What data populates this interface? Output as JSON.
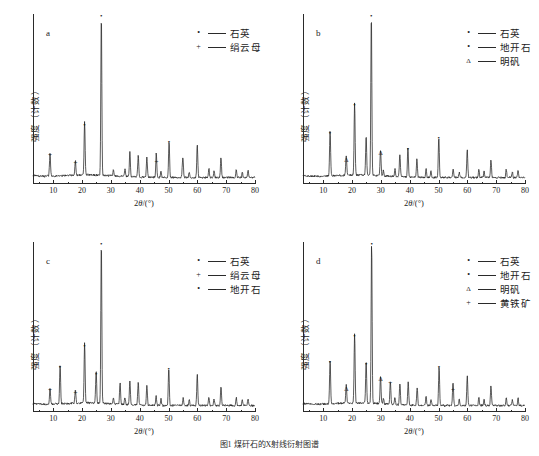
{
  "figure": {
    "caption": "图1  煤矸石的X射线衍射图谱",
    "xlabel_prefix": "2",
    "xlabel_italic": "θ",
    "xlabel_suffix": "/(°)",
    "ylabel": "强度（计数）",
    "marker_dot": "•",
    "marker_plus": "+",
    "marker_triangle": "Δ"
  },
  "axis": {
    "xticks": [
      10,
      20,
      30,
      40,
      50,
      60,
      70,
      80
    ],
    "xmin": 3,
    "xmax": 80
  },
  "panels": [
    {
      "letter": "a",
      "legend": [
        {
          "marker": "•",
          "label": "石英"
        },
        {
          "marker": "+",
          "label": "绢云母"
        }
      ]
    },
    {
      "letter": "b",
      "legend": [
        {
          "marker": "•",
          "label": "石英"
        },
        {
          "marker": "•",
          "label": "地开石"
        },
        {
          "marker": "Δ",
          "label": "明矾"
        }
      ]
    },
    {
      "letter": "c",
      "legend": [
        {
          "marker": "•",
          "label": "石英"
        },
        {
          "marker": "+",
          "label": "绢云母"
        },
        {
          "marker": "•",
          "label": "地开石"
        }
      ]
    },
    {
      "letter": "d",
      "legend": [
        {
          "marker": "•",
          "label": "石英"
        },
        {
          "marker": "•",
          "label": "地开石"
        },
        {
          "marker": "Δ",
          "label": "明矾"
        },
        {
          "marker": "+",
          "label": "黄铁矿"
        }
      ]
    }
  ],
  "chart_data": [
    {
      "type": "line",
      "panel": "a",
      "title": "XRD pattern (a)",
      "xlabel": "2θ/(°)",
      "ylabel": "强度（计数）",
      "xlim": [
        3,
        80
      ],
      "ylim": [
        0,
        100
      ],
      "grid": false,
      "legend_position": "top-right",
      "series": [
        {
          "name": "煤矸石 a",
          "peaks": [
            {
              "x": 8.9,
              "intensity": 14,
              "phase": "绢云母",
              "marker": "+",
              "labeled": true
            },
            {
              "x": 17.7,
              "intensity": 9,
              "phase": "绢云母",
              "marker": "+",
              "labeled": true
            },
            {
              "x": 20.9,
              "intensity": 33,
              "phase": "石英",
              "marker": "•",
              "labeled": true
            },
            {
              "x": 26.7,
              "intensity": 100,
              "phase": "石英",
              "marker": "•",
              "labeled": true
            },
            {
              "x": 36.6,
              "intensity": 15,
              "phase": "石英",
              "marker": "",
              "labeled": false
            },
            {
              "x": 39.5,
              "intensity": 13,
              "phase": "石英",
              "marker": "",
              "labeled": false
            },
            {
              "x": 42.5,
              "intensity": 12,
              "phase": "石英",
              "marker": "",
              "labeled": false
            },
            {
              "x": 45.8,
              "intensity": 10,
              "phase": "绢云母",
              "marker": "+",
              "labeled": true
            },
            {
              "x": 50.2,
              "intensity": 22,
              "phase": "石英",
              "marker": "•",
              "labeled": true
            },
            {
              "x": 54.9,
              "intensity": 9,
              "phase": "石英",
              "marker": "",
              "labeled": false
            },
            {
              "x": 60.0,
              "intensity": 16,
              "phase": "石英",
              "marker": "",
              "labeled": false
            },
            {
              "x": 68.2,
              "intensity": 12,
              "phase": "石英",
              "marker": "",
              "labeled": false
            }
          ]
        }
      ]
    },
    {
      "type": "line",
      "panel": "b",
      "title": "XRD pattern (b)",
      "xlabel": "2θ/(°)",
      "ylabel": "强度（计数）",
      "xlim": [
        3,
        80
      ],
      "ylim": [
        0,
        100
      ],
      "grid": false,
      "legend_position": "top-right",
      "series": [
        {
          "name": "煤矸石 b",
          "peaks": [
            {
              "x": 12.4,
              "intensity": 28,
              "phase": "地开石",
              "marker": "•",
              "labeled": true
            },
            {
              "x": 18.0,
              "intensity": 12,
              "phase": "明矾",
              "marker": "Δ",
              "labeled": true
            },
            {
              "x": 20.9,
              "intensity": 45,
              "phase": "石英",
              "marker": "•",
              "labeled": true
            },
            {
              "x": 24.9,
              "intensity": 24,
              "phase": "地开石",
              "marker": "",
              "labeled": false
            },
            {
              "x": 26.7,
              "intensity": 100,
              "phase": "石英",
              "marker": "•",
              "labeled": true
            },
            {
              "x": 29.9,
              "intensity": 16,
              "phase": "明矾",
              "marker": "Δ",
              "labeled": true
            },
            {
              "x": 36.6,
              "intensity": 14,
              "phase": "石英",
              "marker": "",
              "labeled": false
            },
            {
              "x": 39.4,
              "intensity": 18,
              "phase": "石英",
              "marker": "•",
              "labeled": true
            },
            {
              "x": 42.5,
              "intensity": 11,
              "phase": "石英",
              "marker": "",
              "labeled": false
            },
            {
              "x": 50.1,
              "intensity": 25,
              "phase": "石英",
              "marker": "•",
              "labeled": true
            },
            {
              "x": 60.0,
              "intensity": 13,
              "phase": "石英",
              "marker": "",
              "labeled": false
            },
            {
              "x": 68.2,
              "intensity": 11,
              "phase": "石英",
              "marker": "",
              "labeled": false
            }
          ]
        }
      ]
    },
    {
      "type": "line",
      "panel": "c",
      "title": "XRD pattern (c)",
      "xlabel": "2θ/(°)",
      "ylabel": "强度（计数）",
      "xlim": [
        3,
        80
      ],
      "ylim": [
        0,
        100
      ],
      "grid": false,
      "legend_position": "top-right",
      "series": [
        {
          "name": "煤矸石 c",
          "peaks": [
            {
              "x": 8.9,
              "intensity": 10,
              "phase": "绢云母",
              "marker": "+",
              "labeled": true
            },
            {
              "x": 12.4,
              "intensity": 24,
              "phase": "地开石",
              "marker": "•",
              "labeled": true
            },
            {
              "x": 17.7,
              "intensity": 8,
              "phase": "绢云母",
              "marker": "+",
              "labeled": true
            },
            {
              "x": 20.9,
              "intensity": 37,
              "phase": "石英",
              "marker": "•",
              "labeled": true
            },
            {
              "x": 24.9,
              "intensity": 20,
              "phase": "地开石",
              "marker": "•",
              "labeled": true
            },
            {
              "x": 26.7,
              "intensity": 100,
              "phase": "石英",
              "marker": "•",
              "labeled": true
            },
            {
              "x": 33.2,
              "intensity": 13,
              "phase": "石英",
              "marker": "",
              "labeled": false
            },
            {
              "x": 36.6,
              "intensity": 15,
              "phase": "石英",
              "marker": "",
              "labeled": false
            },
            {
              "x": 39.5,
              "intensity": 14,
              "phase": "石英",
              "marker": "",
              "labeled": false
            },
            {
              "x": 42.5,
              "intensity": 12,
              "phase": "石英",
              "marker": "",
              "labeled": false
            },
            {
              "x": 50.1,
              "intensity": 23,
              "phase": "石英",
              "marker": "•",
              "labeled": true
            },
            {
              "x": 60.0,
              "intensity": 15,
              "phase": "石英",
              "marker": "",
              "labeled": false
            },
            {
              "x": 68.2,
              "intensity": 12,
              "phase": "石英",
              "marker": "",
              "labeled": false
            }
          ]
        }
      ]
    },
    {
      "type": "line",
      "panel": "d",
      "title": "XRD pattern (d)",
      "xlabel": "2θ/(°)",
      "ylabel": "强度（计数）",
      "xlim": [
        3,
        80
      ],
      "ylim": [
        0,
        100
      ],
      "grid": false,
      "legend_position": "top-right",
      "series": [
        {
          "name": "煤矸石 d",
          "peaks": [
            {
              "x": 12.4,
              "intensity": 27,
              "phase": "地开石",
              "marker": "•",
              "labeled": true
            },
            {
              "x": 18.0,
              "intensity": 11,
              "phase": "明矾",
              "marker": "Δ",
              "labeled": true
            },
            {
              "x": 20.9,
              "intensity": 43,
              "phase": "石英",
              "marker": "•",
              "labeled": true
            },
            {
              "x": 24.9,
              "intensity": 26,
              "phase": "地开石",
              "marker": "•",
              "labeled": true
            },
            {
              "x": 26.8,
              "intensity": 100,
              "phase": "石英",
              "marker": "•",
              "labeled": true
            },
            {
              "x": 29.9,
              "intensity": 17,
              "phase": "明矾",
              "marker": "Δ",
              "labeled": true
            },
            {
              "x": 33.3,
              "intensity": 14,
              "phase": "黄铁矿",
              "marker": "+",
              "labeled": true
            },
            {
              "x": 36.6,
              "intensity": 13,
              "phase": "石英",
              "marker": "",
              "labeled": false
            },
            {
              "x": 39.5,
              "intensity": 14,
              "phase": "石英",
              "marker": "",
              "labeled": false
            },
            {
              "x": 42.6,
              "intensity": 11,
              "phase": "石英",
              "marker": "",
              "labeled": false
            },
            {
              "x": 50.2,
              "intensity": 24,
              "phase": "石英",
              "marker": "•",
              "labeled": true
            },
            {
              "x": 55.0,
              "intensity": 10,
              "phase": "黄铁矿",
              "marker": "+",
              "labeled": true
            },
            {
              "x": 60.0,
              "intensity": 14,
              "phase": "石英",
              "marker": "",
              "labeled": false
            },
            {
              "x": 68.2,
              "intensity": 12,
              "phase": "石英",
              "marker": "",
              "labeled": false
            }
          ]
        }
      ]
    }
  ]
}
